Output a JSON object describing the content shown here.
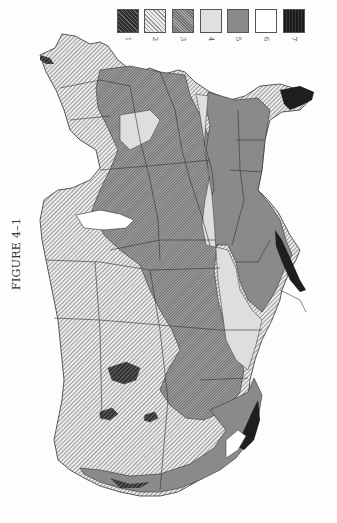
{
  "figure": {
    "label": "FIGURE 4–1",
    "orientation": "rotated 90°"
  },
  "legend": {
    "items": [
      {
        "id": "1",
        "label": "1",
        "pattern": "dense dark diagonal hatch",
        "color": "#4a4a4a"
      },
      {
        "id": "2",
        "label": "2",
        "pattern": "light diagonal hatch",
        "color": "#cfcfcf"
      },
      {
        "id": "3",
        "label": "3",
        "pattern": "medium crosshatch",
        "color": "#8c8c8c"
      },
      {
        "id": "4",
        "label": "4",
        "pattern": "light solid stipple",
        "color": "#dedede"
      },
      {
        "id": "5",
        "label": "5",
        "pattern": "medium solid gray",
        "color": "#8a8a8a"
      },
      {
        "id": "6",
        "label": "6",
        "pattern": "white",
        "color": "#ffffff"
      },
      {
        "id": "7",
        "label": "7",
        "pattern": "black stipple",
        "color": "#1e1e1e"
      }
    ]
  },
  "map": {
    "subject": "United States zone map (rotated), states outlined, regions shaded by zone 1–7"
  }
}
